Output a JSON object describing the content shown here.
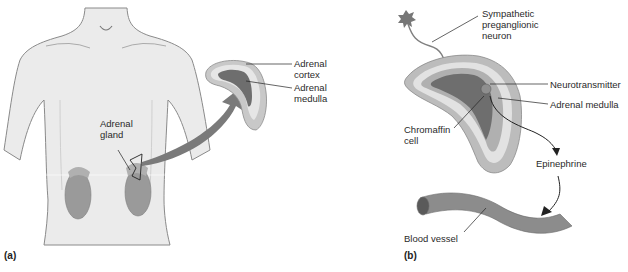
{
  "panels": {
    "a": {
      "label": "(a)",
      "labels": {
        "adrenal_gland_1": "Adrenal",
        "adrenal_gland_2": "gland",
        "adrenal_cortex_1": "Adrenal",
        "adrenal_cortex_2": "cortex",
        "adrenal_medulla_1": "Adrenal",
        "adrenal_medulla_2": "medulla"
      }
    },
    "b": {
      "label": "(b)",
      "labels": {
        "sympathetic_1": "Sympathetic",
        "sympathetic_2": "preganglionic",
        "sympathetic_3": "neuron",
        "neurotransmitter": "Neurotransmitter",
        "adrenal_medulla": "Adrenal medulla",
        "chromaffin_1": "Chromaffin",
        "chromaffin_2": "cell",
        "epinephrine": "Epinephrine",
        "blood_vessel": "Blood vessel"
      }
    }
  },
  "colors": {
    "body": "#ebebeb",
    "body_outline": "#8a8a8a",
    "kidney": "#9a9a9a",
    "arrow": "#7a7a7a",
    "cortex_light": "#d8d8d8",
    "cortex_mid": "#b8b8b8",
    "medulla": "#6e6e6e",
    "vessel": "#8c8c8c"
  }
}
